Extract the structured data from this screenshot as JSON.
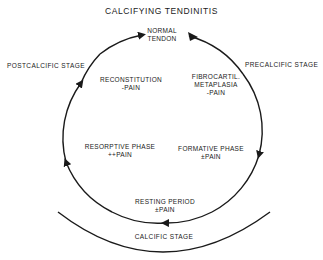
{
  "title": "CALCIFYING TENDINITIS",
  "stages": {
    "precalcific": "PRECALCIFIC STAGE",
    "calcific": "CALCIFIC STAGE",
    "postcalcific": "POSTCALCIFIC STAGE"
  },
  "phases": [
    {
      "id": "normal",
      "lines": [
        "NORMAL",
        "TENDON"
      ]
    },
    {
      "id": "fibrocartilaginous",
      "lines": [
        "FIBROCARTIL.",
        "METAPLASIA",
        "-PAIN"
      ]
    },
    {
      "id": "formative",
      "lines": [
        "FORMATIVE PHASE",
        "±PAIN"
      ]
    },
    {
      "id": "resting",
      "lines": [
        "RESTING PERIOD",
        "±PAIN"
      ]
    },
    {
      "id": "resorptive",
      "lines": [
        "RESORPTIVE PHASE",
        "++PAIN"
      ]
    },
    {
      "id": "reconstitution",
      "lines": [
        "RECONSTITUTION",
        "-PAIN"
      ]
    }
  ],
  "colors": {
    "line": "#1a1a1a",
    "background": "#ffffff"
  }
}
